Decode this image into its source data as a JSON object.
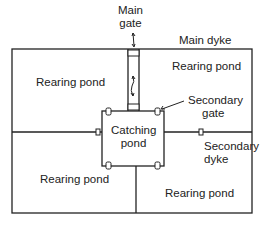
{
  "diagram": {
    "labels": {
      "main_gate_1": "Main",
      "main_gate_2": "gate",
      "main_dyke": "Main dyke",
      "rearing_pond_tl": "Rearing pond",
      "rearing_pond_tr": "Rearing pond",
      "rearing_pond_bl": "Rearing pond",
      "rearing_pond_br": "Rearing pond",
      "catching_pond_1": "Catching",
      "catching_pond_2": "pond",
      "secondary_gate_1": "Secondary",
      "secondary_gate_2": "gate",
      "secondary_dyke_1": "Secondary",
      "secondary_dyke_2": "dyke"
    },
    "colors": {
      "line": "#222222",
      "background": "#ffffff"
    }
  }
}
